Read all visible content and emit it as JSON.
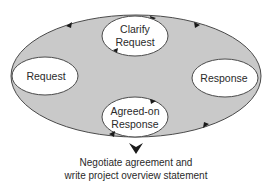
{
  "diagram": {
    "type": "cycle",
    "colors": {
      "outer_fill": "#c9c9c9",
      "outline": "#4a4a4a",
      "node_fill": "#ffffff",
      "text": "#2a2a2a",
      "arrow": "#1a1a1a"
    },
    "nodes": [
      {
        "id": "request",
        "line1": "Request",
        "line2": ""
      },
      {
        "id": "clarify",
        "line1": "Clarify",
        "line2": "Request"
      },
      {
        "id": "response",
        "line1": "Response",
        "line2": ""
      },
      {
        "id": "agreed",
        "line1": "Agreed-on",
        "line2": "Response"
      }
    ],
    "edges": [
      {
        "from": "request",
        "to": "clarify"
      },
      {
        "from": "clarify",
        "to": "response"
      },
      {
        "from": "response",
        "to": "agreed"
      },
      {
        "from": "agreed",
        "to": "request"
      },
      {
        "from": "clarify",
        "to": "clarify",
        "note": "internal loop"
      },
      {
        "from": "agreed",
        "to": "agreed",
        "note": "internal loop"
      }
    ],
    "outcome": {
      "arrow_icon": "down-arrowhead",
      "line1": "Negotiate agreement and",
      "line2": "write project overview statement"
    }
  }
}
